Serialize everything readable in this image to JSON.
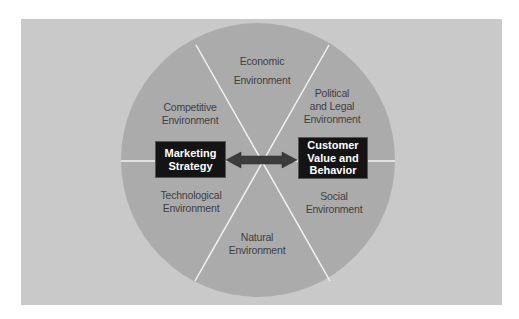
{
  "diagram": {
    "type": "circular-environment-diagram",
    "colors": {
      "panel": "#c9c9c9",
      "circle": "#ababab",
      "lines": "#f2f2f2",
      "box": "#141414",
      "box_text": "#ffffff",
      "arrow": "#3c3c3c",
      "label_text": "#3f3f3f"
    },
    "center_boxes": {
      "left": "Marketing Strategy",
      "right": "Customer Value and Behavior"
    },
    "left_box_lines": [
      "Marketing",
      "Strategy"
    ],
    "right_box_lines": [
      "Customer",
      "Value and",
      "Behavior"
    ],
    "arrow": "bidirectional",
    "segments": [
      {
        "id": "economic",
        "lines": [
          "Economic",
          "Environment"
        ]
      },
      {
        "id": "political",
        "lines": [
          "Political",
          "and Legal",
          "Environment"
        ]
      },
      {
        "id": "social",
        "lines": [
          "Social",
          "Environment"
        ]
      },
      {
        "id": "natural",
        "lines": [
          "Natural",
          "Environment"
        ]
      },
      {
        "id": "technological",
        "lines": [
          "Technological",
          "Environment"
        ]
      },
      {
        "id": "competitive",
        "lines": [
          "Competitive",
          "Environment"
        ]
      }
    ]
  }
}
